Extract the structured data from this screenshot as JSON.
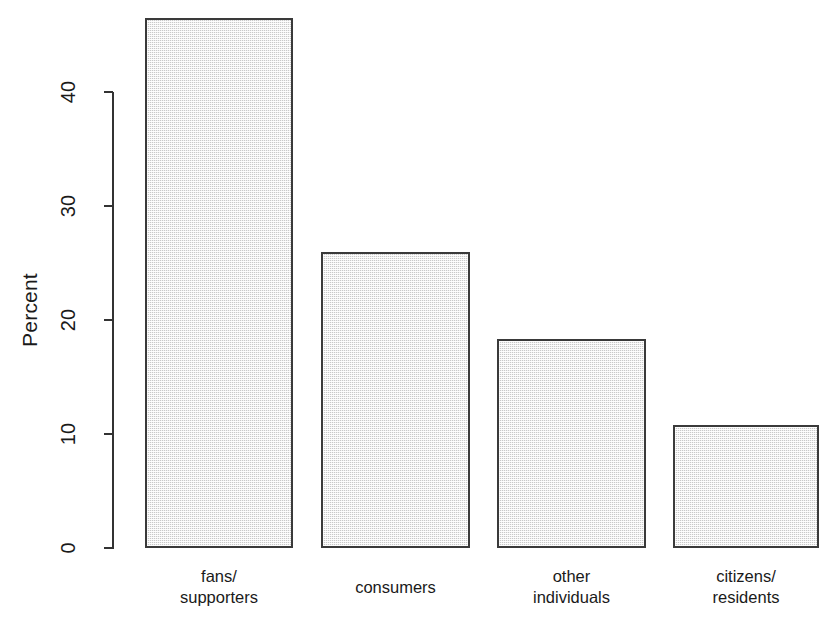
{
  "chart": {
    "type": "bar",
    "ylabel": "Percent",
    "xlabel": "",
    "title": ""
  },
  "chart_data": {
    "type": "bar",
    "title": "",
    "xlabel": "",
    "ylabel": "Percent",
    "categories": [
      "fans/\nsupporters",
      "consumers",
      "other\nindividuals",
      "citizens/\nresidents"
    ],
    "category_lines": [
      [
        "fans/",
        "supporters"
      ],
      [
        "consumers"
      ],
      [
        "other",
        "individuals"
      ],
      [
        "citizens/",
        "residents"
      ]
    ],
    "values": [
      46.5,
      26.0,
      18.3,
      10.8
    ],
    "ylim": [
      0,
      46.5
    ],
    "yticks": [
      0,
      10,
      20,
      30,
      40
    ],
    "ytick_labels": [
      "0",
      "10",
      "20",
      "30",
      "40"
    ],
    "grid": false,
    "legend": null,
    "bar_facecolor": "#c9c9c9",
    "bar_edgecolor": "#3a3a3a",
    "axis_color": "#333333",
    "background": "#ffffff"
  }
}
